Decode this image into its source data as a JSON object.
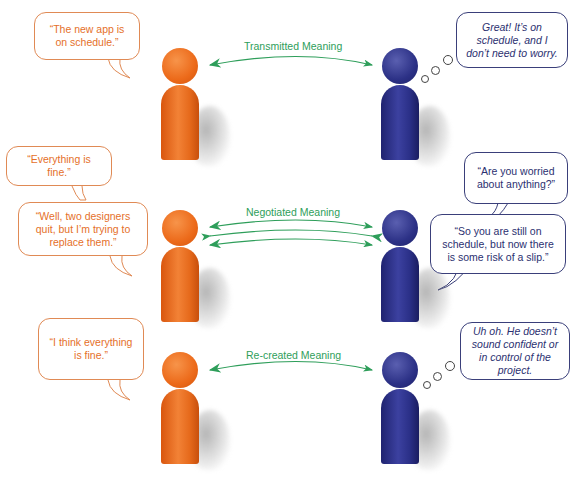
{
  "colors": {
    "sender": "#ec6a1a",
    "receiver": "#2c3186",
    "arrow": "#2e9e5a",
    "sender_text": "#e5702a",
    "receiver_text": "#2b3070"
  },
  "rows": [
    {
      "label": "Transmitted Meaning",
      "sender_bubbles": [
        "“The new app is on schedule.”"
      ],
      "receiver_thought": "Great! It’s on schedule, and I don’t need to worry.",
      "arrows": [
        "right"
      ]
    },
    {
      "label": "Negotiated Meaning",
      "sender_bubbles": [
        "“Everything is fine.”",
        "“Well, two designers quit, but I’m trying to replace them.”"
      ],
      "receiver_bubbles": [
        "“Are you worried about anything?”",
        "“So you are still on schedule, but now there is some risk of a slip.”"
      ],
      "arrows": [
        "right",
        "left",
        "right"
      ]
    },
    {
      "label": "Re-created Meaning",
      "sender_bubbles": [
        "“I think everything is fine.”"
      ],
      "receiver_thought": "Uh oh. He doesn’t sound confident or in control of the project.",
      "arrows": [
        "right"
      ]
    }
  ]
}
